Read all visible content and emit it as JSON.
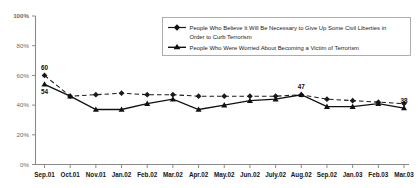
{
  "chart_data": {
    "type": "line",
    "title": "",
    "xlabel": "",
    "ylabel": "",
    "ylim": [
      0,
      100
    ],
    "ytick_labels": [
      "0%",
      "20%",
      "40%",
      "60%",
      "80%",
      "100%"
    ],
    "ytick_values": [
      0,
      20,
      40,
      60,
      80,
      100
    ],
    "grid": false,
    "legend_position": "top-right",
    "categories": [
      "Sep.01",
      "Oct.01",
      "Nov.01",
      "Jan.02",
      "Feb.02",
      "Mar.02",
      "Apr.02",
      "May.02",
      "Jun.02",
      "July.02",
      "Aug.02",
      "Sep.02",
      "Jan.03",
      "Feb.03",
      "Mar.03"
    ],
    "series": [
      {
        "name": "People Who Believe It Will Be Necessary to Give Up Some Civil Liberties in Order to Curb Terrorism",
        "style": "dashed",
        "marker": "diamond",
        "color": "#1a1a1a",
        "values": [
          60,
          46,
          47,
          48,
          47,
          47,
          46,
          46,
          46,
          46,
          47,
          44,
          43,
          42,
          41
        ],
        "point_labels": {
          "0": "60",
          "10": "47"
        }
      },
      {
        "name": "People Who Were Worried About Becoming a Victim of Terrorism",
        "style": "solid",
        "marker": "triangle",
        "color": "#111111",
        "values": [
          54,
          46,
          37,
          37,
          41,
          44,
          37,
          40,
          43,
          44,
          47,
          39,
          39,
          41,
          38
        ],
        "point_labels": {
          "0": "54",
          "14": "38"
        }
      }
    ]
  },
  "legend": {
    "entries": [
      {
        "line1": "People Who Believe It Will Be Necessary to Give Up Some Civil Liberties in",
        "line2": "Order to Curb Terrorism"
      },
      {
        "line1": "People Who Were Worried About Becoming a Victim of Terrorism",
        "line2": ""
      }
    ]
  }
}
